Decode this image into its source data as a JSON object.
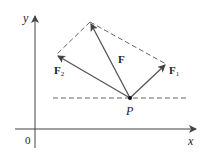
{
  "diagram": {
    "axes": {
      "x_label": "x",
      "y_label": "y",
      "origin_label": "0"
    },
    "point": {
      "label": "P"
    },
    "vectors": [
      {
        "name": "F",
        "label": "F",
        "subscript": ""
      },
      {
        "name": "F1",
        "label": "F",
        "subscript": "1"
      },
      {
        "name": "F2",
        "label": "F",
        "subscript": "2"
      }
    ],
    "colors": {
      "vector": "#555555",
      "axis": "#444444",
      "dashed": "#555555"
    }
  }
}
